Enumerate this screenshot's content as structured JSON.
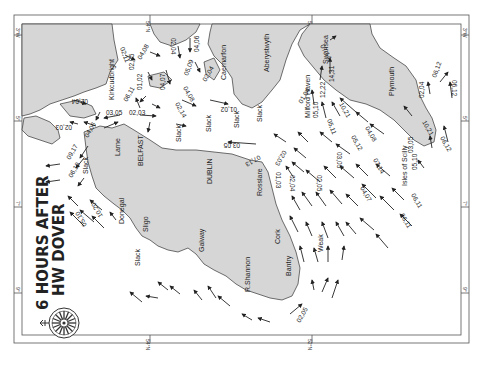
{
  "map": {
    "title_line1": "6 HOURS AFTER",
    "title_line2": "HW DOVER",
    "orientation": "rotated 90° clockwise (north to the left)",
    "colors": {
      "land": "#d6d6d6",
      "sea": "#ffffff",
      "ink": "#222222",
      "frame": "#555555"
    },
    "graticule": {
      "top": [
        "54°N",
        "52°N",
        "50°N"
      ],
      "bottom": [
        "54°N",
        "52°N",
        "50°N"
      ],
      "left": [
        "3°W",
        "5°",
        "7°",
        "9°"
      ],
      "right": [
        "3°W",
        "5°",
        "7°",
        "9°"
      ]
    },
    "places": {
      "kirkcudbright": "Kirkcudbright",
      "caernarfon": "Caernarfon",
      "aberystwyth": "Aberystwyth",
      "milford_haven": "Milford Haven",
      "swansea": "Swansea",
      "plymouth": "Plymouth",
      "belfast": "BELFAST",
      "larne": "Larne",
      "dublin": "DUBLIN",
      "rosslare": "Rosslare",
      "donegal": "Donegal",
      "sligo": "Sligo",
      "galway": "Galway",
      "shannon": "R.Shannon",
      "cork": "Cork",
      "bantry": "Bantry",
      "scilly": "Isles of Scilly"
    },
    "notes": {
      "slack1": "Slack",
      "slack2": "Slack",
      "slack3": "Slack",
      "slack4": "Slack",
      "slack5": "Slack",
      "slack6": "Slack",
      "weak": "Weak"
    },
    "rates": {
      "r_0211": "02,11",
      "r_0408": "04,08",
      "r_0204a": "02,04",
      "r_0406": "04,06",
      "r_0205a": "02,05",
      "r_0102": "01,02",
      "r_0509": "05,09",
      "r_0204b": "02,04",
      "r_0407": "04,07",
      "r_0611": "06,11",
      "r_0408b": "04,08",
      "r_0204c": "02,04",
      "r_0305": "03,05",
      "r_0203": "02,03",
      "r_0214": "02,14",
      "r_0102b": "01,02",
      "r_0203b": "02,03",
      "r_0406b": "04,06",
      "r_0917": "09,17",
      "r_0610": "06,10",
      "r_1020": "10,20",
      "r_0510": "05,10",
      "r_0305b": "03,05",
      "r_0713": "07,13",
      "r_0203c": "02,03",
      "r_0103": "01,03",
      "r_0204d": "02,04",
      "r_0205b": "02,05",
      "r_0305c": "03,05",
      "r_0104": "01,04",
      "r_0510b": "05,10",
      "r_1222": "12,22",
      "r_1431": "14,31",
      "r_0714": "07,14",
      "r_1021": "10,21",
      "r_0511": "05,11",
      "r_0408c": "04,08",
      "r_0512": "05,12",
      "r_0714b": "07,14",
      "r_0407b": "04,07",
      "r_0204e": "02,04",
      "r_0612": "06,12",
      "r_0612b": "06,12",
      "r_1021b": "10,21",
      "r_0305d": "03,05",
      "r_0612c": "06,12",
      "r_0510c": "05,10",
      "r_0611b": "06,11",
      "r_0611c": "06,11",
      "r_0205c": "02,05",
      "r_0107": "01,07"
    }
  }
}
